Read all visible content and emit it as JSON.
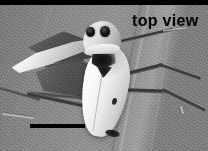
{
  "figure": {
    "kind": "photomicrograph",
    "width": 208,
    "height": 151,
    "palette": {
      "background_gray": "#8a8a8a",
      "body_white": "#f4f4f4",
      "marking_black": "#141414",
      "annotation_black": "#000000"
    }
  },
  "annotations": {
    "view_label": "top view",
    "scale_bar": {
      "name": "scale-bar",
      "visible": true,
      "caption": ""
    },
    "top_border": {
      "name": "top-black-bar",
      "visible": true
    }
  },
  "specimen": {
    "head": {
      "label": "head",
      "eye_left": "compound-eye-left",
      "eye_right": "compound-eye-right"
    },
    "thorax": {
      "label": "thorax",
      "marking": "dark-triangular-marking"
    },
    "wings": {
      "label": "forewings",
      "color": "white",
      "spot": "dark-wing-spot",
      "tip": "dark-abdomen-tip",
      "left_hindwing": "pale-left-wing",
      "left_dark_wing": "dark-left-wing"
    },
    "legs": {
      "label": "legs",
      "count_visible": 6
    }
  },
  "background": {
    "label": "leaf-surface",
    "veins_visible": true
  }
}
